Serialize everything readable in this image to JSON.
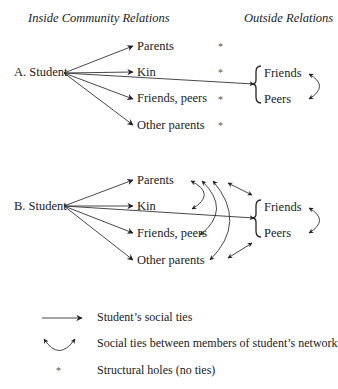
{
  "headers": {
    "inside": "Inside Community Relations",
    "outside": "Outside Relations"
  },
  "panel_a": {
    "student_label": "A. Student",
    "targets": [
      "Parents",
      "Kin",
      "Friends, peers",
      "Other parents"
    ],
    "structural_hole_marks": [
      "*",
      "*",
      "*",
      "*"
    ],
    "outside": [
      "Friends",
      "Peers"
    ]
  },
  "panel_b": {
    "student_label": "B. Student",
    "targets": [
      "Parents",
      "Kin",
      "Friends, peers",
      "Other parents"
    ],
    "outside": [
      "Friends",
      "Peers"
    ]
  },
  "legend": {
    "items": [
      {
        "icon": "straight-arrow-icon",
        "label": "Student’s social ties"
      },
      {
        "icon": "curved-double-arrow-icon",
        "label": "Social ties between members of student’s network"
      },
      {
        "icon": "asterisk-icon",
        "symbol": "*",
        "label": "Structural holes (no ties)"
      }
    ]
  },
  "colors": {
    "stroke": "#333333",
    "text": "#222222",
    "background": "#ffffff"
  }
}
